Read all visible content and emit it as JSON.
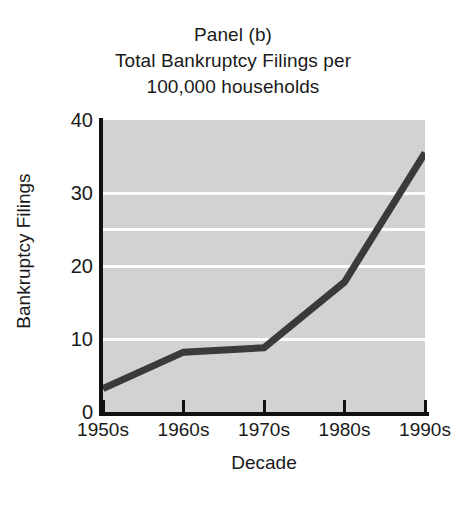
{
  "chart_data": {
    "type": "line",
    "title": "Panel (b) Total Bankruptcy Filings per 100,000 households",
    "title_lines": [
      "Panel (b)",
      "Total Bankruptcy Filings per",
      "100,000 households"
    ],
    "xlabel": "Decade",
    "ylabel": "Bankruptcy Filings",
    "categories": [
      "1950s",
      "1960s",
      "1970s",
      "1980s",
      "1990s"
    ],
    "values": [
      3.2,
      8.2,
      8.8,
      17.8,
      35.5
    ],
    "series": [
      {
        "name": "Bankruptcy Filings",
        "values": [
          3.2,
          8.2,
          8.8,
          17.8,
          35.5
        ]
      }
    ],
    "ylim": [
      0,
      40
    ],
    "y_ticks": [
      0,
      10,
      20,
      30,
      40
    ],
    "y_tick_labels": [
      "0",
      "10",
      "20",
      "30",
      "40"
    ],
    "gridlines_at": [
      10,
      20,
      25,
      30
    ],
    "grid": true,
    "legend": "none",
    "line_color": "#3a3a3a",
    "plot_background": "#d2d2d2",
    "gridline_color": "#fdfdfd",
    "axis_color": "#111111"
  }
}
